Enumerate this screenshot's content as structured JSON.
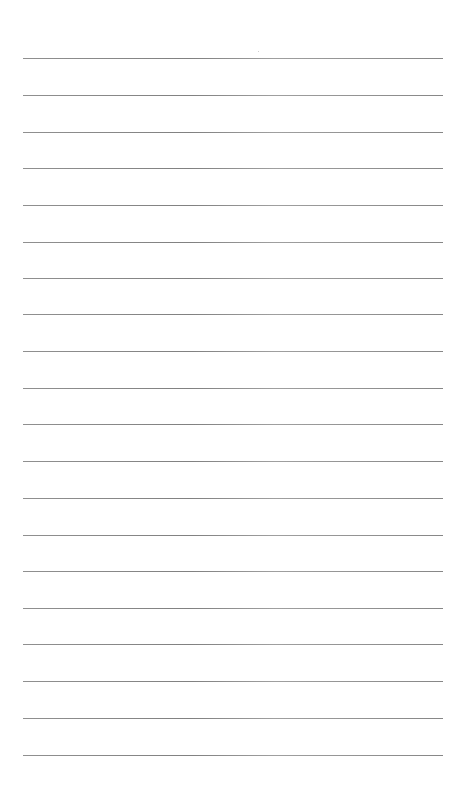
{
  "page": {
    "type": "ruled-paper",
    "background_color": "#ffffff",
    "rule_color": "#858585",
    "rule_count": 20,
    "rule_left": 23,
    "rule_width": 420,
    "rules_y": [
      58,
      95,
      132,
      168,
      205,
      242,
      278,
      314,
      351,
      388,
      424,
      461,
      498,
      535,
      571,
      608,
      644,
      681,
      718,
      755
    ]
  }
}
